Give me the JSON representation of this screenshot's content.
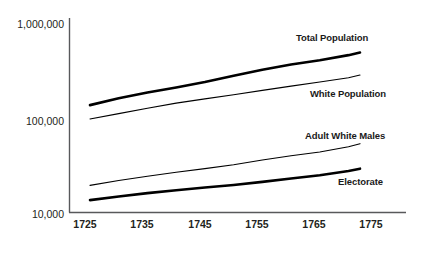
{
  "chart_data": {
    "type": "line",
    "title": "",
    "xlabel": "",
    "ylabel": "",
    "yscale": "log",
    "ylim": [
      10000,
      1000000
    ],
    "xlim": [
      1725,
      1780
    ],
    "grid": false,
    "legend_position": "inline-right-of-line-ends",
    "y_tick_labels": [
      "1,000,000",
      "100,000",
      "10,000"
    ],
    "y_tick_values": [
      1000000,
      100000,
      10000
    ],
    "x_tick_labels": [
      "1725",
      "1735",
      "1745",
      "1755",
      "1765",
      "1775"
    ],
    "x_tick_values": [
      1725,
      1735,
      1745,
      1755,
      1765,
      1775
    ],
    "x": [
      1726,
      1731,
      1736,
      1741,
      1746,
      1751,
      1756,
      1761,
      1766,
      1771,
      1773
    ],
    "series": [
      {
        "name": "Total Population",
        "label": "Total Population",
        "linewidth": 2.6,
        "color": "#000000",
        "values": [
          140000,
          165000,
          190000,
          215000,
          245000,
          285000,
          330000,
          375000,
          415000,
          470000,
          500000
        ]
      },
      {
        "name": "White Population",
        "label": "White Population",
        "linewidth": 1.1,
        "color": "#000000",
        "values": [
          100000,
          114000,
          130000,
          147000,
          163000,
          180000,
          200000,
          222000,
          245000,
          272000,
          290000
        ]
      },
      {
        "name": "Adult White Males",
        "label": "Adult White Males",
        "linewidth": 1.1,
        "color": "#000000",
        "values": [
          20000,
          22500,
          25000,
          27500,
          30000,
          33000,
          37000,
          41000,
          45000,
          51000,
          55000
        ]
      },
      {
        "name": "Electorate",
        "label": "Electorate",
        "linewidth": 2.6,
        "color": "#000000",
        "values": [
          14000,
          15300,
          16600,
          17800,
          19000,
          20200,
          21800,
          23600,
          25600,
          28400,
          30000
        ]
      }
    ]
  },
  "axes": {
    "axis_color": "#58595b",
    "y_axis_label_1": "1,000,000",
    "y_axis_label_2": "100,000",
    "y_axis_label_3": "10,000",
    "x_axis_label_1": "1725",
    "x_axis_label_2": "1735",
    "x_axis_label_3": "1745",
    "x_axis_label_4": "1755",
    "x_axis_label_5": "1765",
    "x_axis_label_6": "1775"
  },
  "series_labels": {
    "total_population": "Total Population",
    "white_population": "White Population",
    "adult_white_males": "Adult White Males",
    "electorate": "Electorate"
  },
  "caption": {
    "text": ""
  }
}
